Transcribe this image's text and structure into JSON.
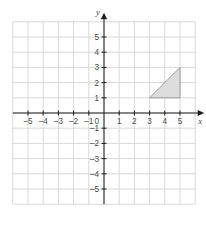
{
  "chart_data": {
    "type": "scatter",
    "title": "",
    "subtitle": "",
    "xlabel": "x",
    "ylabel": "y",
    "xlim": [
      -6,
      6
    ],
    "ylim": [
      -6,
      6
    ],
    "grid": true,
    "grid_step": 1,
    "legend": "none",
    "origin_label": "0",
    "x_ticks": [
      -5,
      -4,
      -3,
      -2,
      -1,
      1,
      2,
      3,
      4,
      5
    ],
    "y_ticks": [
      -5,
      -4,
      -3,
      -2,
      -1,
      1,
      2,
      3,
      4,
      5
    ],
    "x_tick_labels": [
      "–5",
      "–4",
      "–3",
      "–2",
      "–1",
      "1",
      "2",
      "3",
      "4",
      "5"
    ],
    "y_tick_labels": [
      "–5",
      "–4",
      "–3",
      "–2",
      "–1",
      "1",
      "2",
      "3",
      "4",
      "5"
    ],
    "shapes": [
      {
        "name": "shaded-right-triangle",
        "kind": "polygon",
        "points": [
          [
            3,
            1
          ],
          [
            5,
            1
          ],
          [
            5,
            3
          ]
        ],
        "fill": "#dcdcdc",
        "stroke": "#9a9a9a",
        "label": ""
      }
    ],
    "annotations": [],
    "colors": {
      "background": "#ffffff",
      "grid": "#d8d8d8",
      "axis": "#1d1d1d",
      "tick_text": "#4a4a4a",
      "shape_fill": "#dcdcdc",
      "shape_stroke": "#9a9a9a"
    }
  }
}
